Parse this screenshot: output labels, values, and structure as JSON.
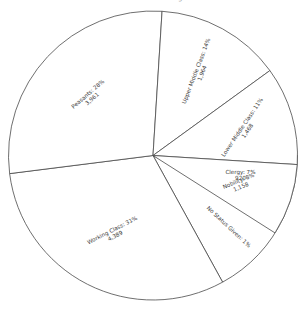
{
  "title": {
    "text": "Social Status of Emigrants",
    "clipped": true
  },
  "chart_data": {
    "type": "pie",
    "title": "Social Status of Emigrants",
    "xlabel": "",
    "ylabel": "",
    "legend": "none",
    "grid": false,
    "label_format": "{name}: {percent}%\n{value}",
    "categories": [
      "Clergy",
      "No Status Given",
      "Working Class",
      "Peasants",
      "Upper Middle Class",
      "Lower Middle Class",
      "Nobility"
    ],
    "values": [
      920,
      141,
      4389,
      3961,
      1964,
      1468,
      1158
    ],
    "percents": [
      7,
      1,
      31,
      28,
      14,
      11,
      8
    ],
    "slices": [
      {
        "name": "Clergy",
        "percent": 7,
        "value": "920",
        "label_line1": "Clergy: 7%",
        "label_line2": "920",
        "start_angle": 0,
        "end_angle": 25.2,
        "label_rotation": 0,
        "label_radius_frac": 0.62,
        "color": "#ffffff",
        "stroke": "#4a4a4a"
      },
      {
        "name": "No Status Given",
        "percent": 1,
        "value": "",
        "label_line1": "No Status Given: 1%",
        "label_line2": "",
        "start_angle": 25.2,
        "end_angle": 61.2,
        "label_rotation": 43,
        "label_radius_frac": 0.72,
        "color": "#ffffff",
        "stroke": "#4a4a4a"
      },
      {
        "name": "Working Class",
        "percent": 31,
        "value": "4,389",
        "label_line1": "Working Class: 31%",
        "label_line2": "4,389",
        "start_angle": 61.2,
        "end_angle": 172.8,
        "label_rotation": -27,
        "label_radius_frac": 0.6,
        "color": "#ffffff",
        "stroke": "#4a4a4a"
      },
      {
        "name": "Peasants",
        "percent": 28,
        "value": "3,961",
        "label_line1": "Peasants: 28%",
        "label_line2": "3,961",
        "start_angle": 172.8,
        "end_angle": 273.6,
        "label_rotation": -41,
        "label_radius_frac": 0.6,
        "color": "#ffffff",
        "stroke": "#4a4a4a"
      },
      {
        "name": "Upper Middle Class",
        "percent": 14,
        "value": "1,964",
        "label_line1": "Upper Middle Class: 14%",
        "label_line2": "1,964",
        "start_angle": 273.6,
        "end_angle": 324,
        "label_rotation": -69,
        "label_radius_frac": 0.66,
        "color": "#ffffff",
        "stroke": "#4a4a4a"
      },
      {
        "name": "Lower Middle Class",
        "percent": 11,
        "value": "1,468",
        "label_line1": "Lower Middle Class: 11%",
        "label_line2": "1,468",
        "start_angle": 324,
        "end_angle": 363.6,
        "label_rotation": -56,
        "label_radius_frac": 0.66,
        "color": "#ffffff",
        "stroke": "#4a4a4a"
      },
      {
        "name": "Nobility",
        "percent": 8,
        "value": "1,158",
        "label_line1": "Nobility: 8%",
        "label_line2": "1,158",
        "start_angle": 363.6,
        "end_angle": 392.4,
        "label_rotation": -22,
        "label_radius_frac": 0.63,
        "color": "#ffffff",
        "stroke": "#4a4a4a"
      }
    ],
    "geometry": {
      "center_x": 153,
      "center_y": 155.5,
      "radius": 144.5
    }
  }
}
